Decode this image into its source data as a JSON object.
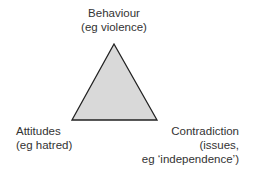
{
  "diagram": {
    "colors": {
      "fill": "#d9d9d9",
      "stroke": "#222222",
      "text": "#333333"
    },
    "vertices": {
      "top": {
        "line1": "Behaviour",
        "line2": "(eg violence)"
      },
      "left": {
        "line1": "Attitudes",
        "line2": "(eg hatred)"
      },
      "right": {
        "line1": "Contradiction",
        "line2": "(issues,",
        "line3": "eg ‘independence’)"
      }
    }
  }
}
